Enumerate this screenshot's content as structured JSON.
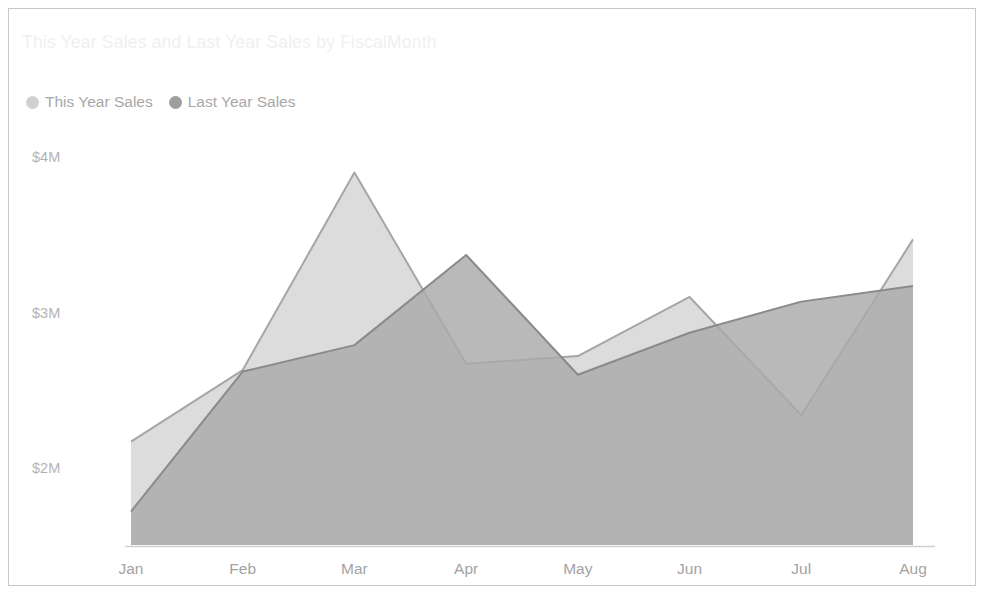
{
  "visual": {
    "title": "This Year Sales and Last Year Sales by FiscalMonth",
    "border_color": "#c8c8c8",
    "background": "#ffffff"
  },
  "legend": {
    "position": "top-left",
    "items": [
      {
        "label": "This Year Sales",
        "color": "#d9d9d9",
        "marker": "circle-marker"
      },
      {
        "label": "Last Year Sales",
        "color": "#9e9e9e",
        "marker": "circle-marker"
      }
    ]
  },
  "axes": {
    "y_ticks": [
      "$2M",
      "$3M",
      "$4M"
    ],
    "x_ticks": [
      "Jan",
      "Feb",
      "Mar",
      "Apr",
      "May",
      "Jun",
      "Jul",
      "Aug"
    ],
    "y_tick_color": "#b3b3b3",
    "x_tick_color": "#a3a3a3",
    "axis_line_color": "#d0d0d0"
  },
  "chart_data": {
    "type": "area",
    "title": "This Year Sales and Last Year Sales by FiscalMonth",
    "xlabel": "FiscalMonth",
    "ylabel": "",
    "categories": [
      "Jan",
      "Feb",
      "Mar",
      "Apr",
      "May",
      "Jun",
      "Jul",
      "Aug"
    ],
    "series": [
      {
        "name": "This Year Sales",
        "values": [
          2.17,
          2.63,
          3.9,
          2.67,
          2.72,
          3.1,
          2.34,
          3.47
        ],
        "unit": "$M",
        "fill": "#dcdcdc",
        "stroke": "#a6a6a6"
      },
      {
        "name": "Last Year Sales",
        "values": [
          1.72,
          2.62,
          2.79,
          3.37,
          2.6,
          2.87,
          3.07,
          3.17
        ],
        "unit": "$M",
        "fill": "#a9a9a9",
        "stroke": "#8a8a8a"
      }
    ],
    "ylim": [
      1.5,
      4.2
    ],
    "y_tick_values": [
      2,
      3,
      4
    ],
    "y_tick_labels": [
      "$2M",
      "$3M",
      "$4M"
    ],
    "grid": false,
    "legend_position": "top-left"
  }
}
